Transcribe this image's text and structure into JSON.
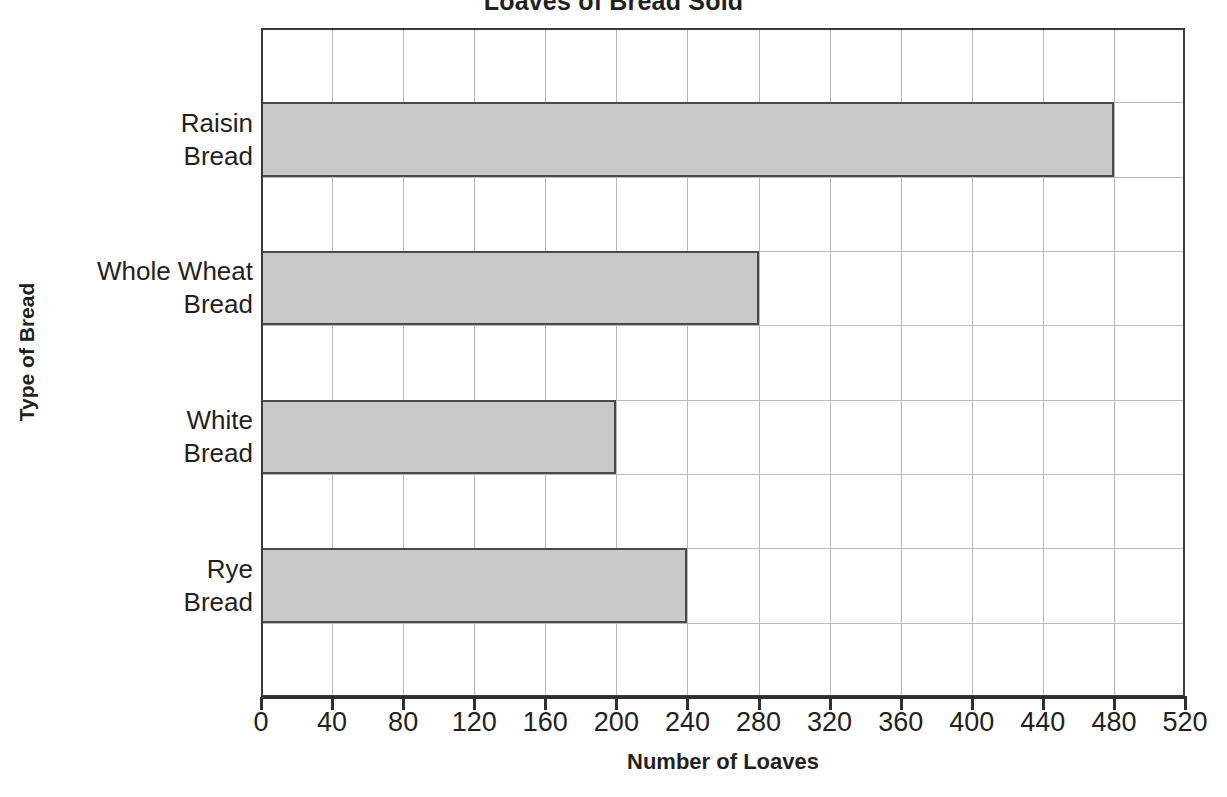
{
  "chart_data": {
    "type": "bar",
    "orientation": "horizontal",
    "title": "Loaves of Bread Sold",
    "xlabel": "Number of Loaves",
    "ylabel": "Type of Bread",
    "categories": [
      "Raisin Bread",
      "Whole Wheat Bread",
      "White Bread",
      "Rye Bread"
    ],
    "category_lines": [
      [
        "Raisin",
        "Bread"
      ],
      [
        "Whole Wheat",
        "Bread"
      ],
      [
        "White",
        "Bread"
      ],
      [
        "Rye",
        "Bread"
      ]
    ],
    "values": [
      480,
      280,
      200,
      240
    ],
    "xlim": [
      0,
      520
    ],
    "xticks": [
      0,
      40,
      80,
      120,
      160,
      200,
      240,
      280,
      320,
      360,
      400,
      440,
      480,
      520
    ],
    "xtick_labels": [
      "0",
      "40",
      "80",
      "120",
      "160",
      "200",
      "240",
      "280",
      "320",
      "360",
      "400",
      "440",
      "480",
      "520"
    ],
    "xtick_step": 40,
    "grid": true,
    "grid_axis": "both",
    "legend": false,
    "bar_fill_color": "#c9c9c9",
    "bar_border_color": "#4a4a4a",
    "grid_color": "#b9b9b9",
    "axis_color": "#2f2f2f",
    "text_color": "#231f20"
  }
}
